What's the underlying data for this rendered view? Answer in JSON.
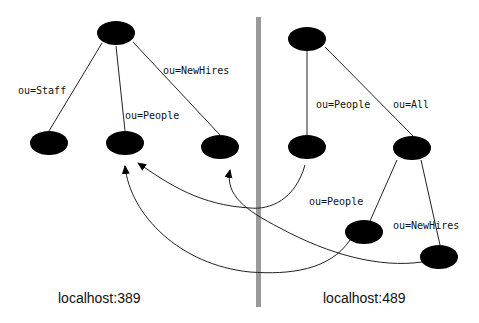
{
  "colors": {
    "node": "#000000",
    "edge": "#222222",
    "divider": "#9a9a9a",
    "background": "#ffffff"
  },
  "servers": [
    {
      "label": "localhost:389",
      "nodes": [
        {
          "id": "root",
          "cx": 128,
          "cy": 33
        },
        {
          "id": "staff",
          "cx": 49,
          "cy": 143
        },
        {
          "id": "people",
          "cx": 125,
          "cy": 143
        },
        {
          "id": "newhires",
          "cx": 220,
          "cy": 147
        }
      ],
      "edges": [
        {
          "from": "root",
          "to": "staff",
          "label": "ou=Staff"
        },
        {
          "from": "root",
          "to": "people",
          "label": "ou=People"
        },
        {
          "from": "root",
          "to": "newhires",
          "label": "ou=NewHires"
        }
      ]
    },
    {
      "label": "localhost:489",
      "nodes": [
        {
          "id": "root",
          "cx": 308,
          "cy": 39
        },
        {
          "id": "people",
          "cx": 307,
          "cy": 147
        },
        {
          "id": "all",
          "cx": 413,
          "cy": 148
        },
        {
          "id": "all-people",
          "cx": 364,
          "cy": 232
        },
        {
          "id": "all-newhires",
          "cx": 440,
          "cy": 257
        }
      ],
      "edges": [
        {
          "from": "root",
          "to": "people",
          "label": "ou=People"
        },
        {
          "from": "root",
          "to": "all",
          "label": "ou=All"
        },
        {
          "from": "all",
          "to": "all-people",
          "label": "ou=People"
        },
        {
          "from": "all",
          "to": "all-newhires",
          "label": "ou=NewHires"
        }
      ]
    }
  ],
  "references": [
    {
      "from": "localhost:489/people",
      "to": "localhost:389/people"
    },
    {
      "from": "localhost:489/all-newhires",
      "to": "localhost:389/newhires"
    },
    {
      "from": "localhost:489/all-people",
      "to": "localhost:389/people"
    }
  ],
  "labels": {
    "left_server": "localhost:389",
    "right_server": "localhost:489",
    "left_edges": [
      "ou=Staff",
      "ou=People",
      "ou=NewHires"
    ],
    "right_edges": [
      "ou=People",
      "ou=All",
      "ou=People",
      "ou=NewHires"
    ]
  }
}
